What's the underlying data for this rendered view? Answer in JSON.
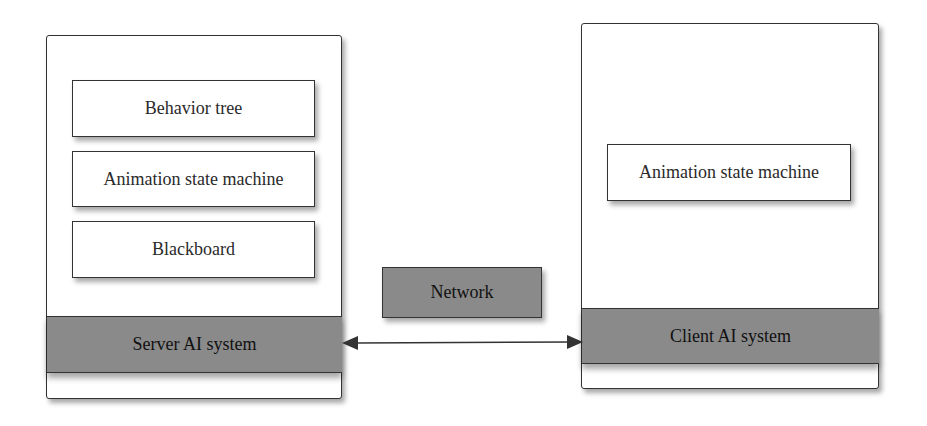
{
  "server": {
    "label": "Server AI system",
    "components": [
      "Behavior tree",
      "Animation state machine",
      "Blackboard"
    ]
  },
  "client": {
    "label": "Client AI system",
    "components": [
      "Animation state machine"
    ]
  },
  "network": {
    "label": "Network"
  },
  "colors": {
    "bar_fill": "#8a8a8a",
    "border": "#333333",
    "background": "#ffffff"
  }
}
